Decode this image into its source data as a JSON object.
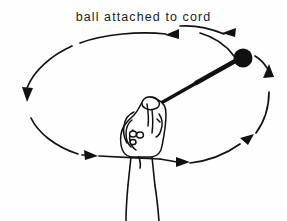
{
  "figure": {
    "caption": "ball attached to cord",
    "background_color": "#fefefe",
    "ink_color": "#111111",
    "elements": {
      "ball_label": "ball",
      "cord_label": "cord",
      "hand_label": "hand",
      "forearm_label": "forearm",
      "path_label": "circular-path"
    },
    "geometry": {
      "ellipse_center_x": 143,
      "ellipse_center_y": 108,
      "ellipse_radius_x": 120,
      "ellipse_radius_y": 62,
      "ball_center_x": 243,
      "ball_center_y": 58,
      "ball_radius": 9,
      "cord_start_x": 160,
      "cord_start_y": 103,
      "cord_end_x": 236,
      "cord_end_y": 62
    },
    "direction_arrows": [
      {
        "name": "arrow-top-right",
        "x": 232,
        "y": 32,
        "heading": "left"
      },
      {
        "name": "arrow-top-left",
        "x": 172,
        "y": 38,
        "heading": "left"
      },
      {
        "name": "arrow-left",
        "x": 27,
        "y": 97,
        "heading": "down"
      },
      {
        "name": "arrow-bottom-left",
        "x": 90,
        "y": 156,
        "heading": "right"
      },
      {
        "name": "arrow-bottom-center",
        "x": 181,
        "y": 163,
        "heading": "right"
      },
      {
        "name": "arrow-bottom-right",
        "x": 245,
        "y": 142,
        "heading": "up-right"
      },
      {
        "name": "arrow-right",
        "x": 268,
        "y": 78,
        "heading": "up"
      }
    ]
  }
}
